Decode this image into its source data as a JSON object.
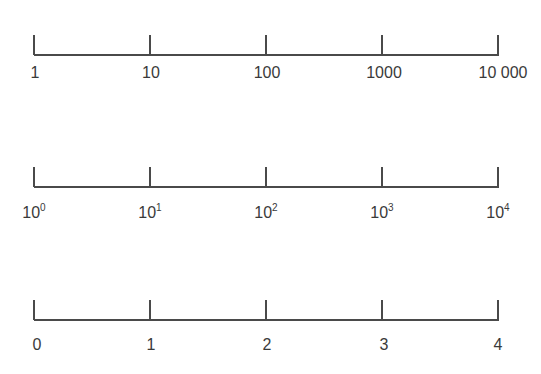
{
  "tick_x": [
    34,
    150,
    266,
    382,
    498
  ],
  "scales": [
    {
      "name": "linear-number-scale",
      "labels": [
        "1",
        "10",
        "100",
        "1000",
        "10 000"
      ]
    },
    {
      "name": "power-of-ten-scale",
      "labels": [
        {
          "base": "10",
          "exp": "0"
        },
        {
          "base": "10",
          "exp": "1"
        },
        {
          "base": "10",
          "exp": "2"
        },
        {
          "base": "10",
          "exp": "3"
        },
        {
          "base": "10",
          "exp": "4"
        }
      ]
    },
    {
      "name": "exponent-scale",
      "labels": [
        "0",
        "1",
        "2",
        "3",
        "4"
      ]
    }
  ],
  "line_color": "#4a4a4a",
  "text_color": "#3a3a3a"
}
